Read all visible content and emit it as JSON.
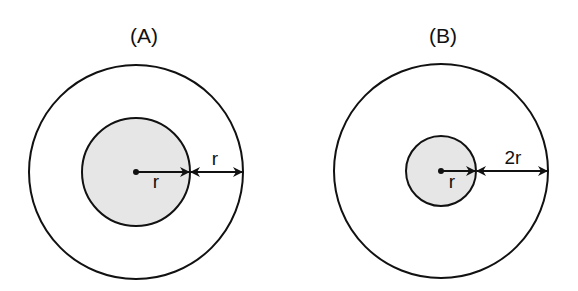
{
  "figures": [
    {
      "id": "A",
      "label": "(A)",
      "label_pos": [
        144,
        43
      ],
      "center": [
        136,
        172
      ],
      "outer_radius": 107,
      "inner_radius": 54,
      "inner_arrow_label": "r",
      "inner_label_pos": [
        156,
        188
      ],
      "gap_arrow_label": "r",
      "gap_label_pos": [
        215,
        165
      ]
    },
    {
      "id": "B",
      "label": "(B)",
      "label_pos": [
        443,
        43
      ],
      "center": [
        441,
        171
      ],
      "outer_radius": 107,
      "inner_radius": 35,
      "inner_arrow_label": "r",
      "inner_label_pos": [
        452,
        188
      ],
      "gap_arrow_label": "2r",
      "gap_label_pos": [
        513,
        164
      ]
    }
  ],
  "colors": {
    "stroke": "#111111",
    "inner_fill": "#e6e6e6",
    "background": "#ffffff"
  }
}
